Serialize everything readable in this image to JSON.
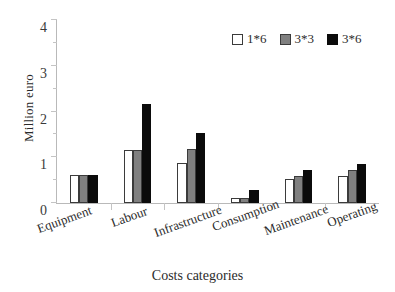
{
  "chart_data": {
    "type": "bar",
    "title": "",
    "xlabel": "Costs categories",
    "ylabel": "Million euro",
    "categories": [
      "Equipment",
      "Labour",
      "Infrastructure",
      "Consumption",
      "Maintenance",
      "Operating"
    ],
    "series": [
      {
        "name": "1*6",
        "color": "#ffffff",
        "values": [
          0.62,
          1.15,
          0.87,
          0.12,
          0.52,
          0.58
        ]
      },
      {
        "name": "3*3",
        "color": "#808080",
        "values": [
          0.62,
          1.15,
          1.18,
          0.12,
          0.59,
          0.73
        ]
      },
      {
        "name": "3*6",
        "color": "#000000",
        "values": [
          0.62,
          2.17,
          1.53,
          0.28,
          0.72,
          0.85
        ]
      }
    ],
    "ylim": [
      0,
      4
    ],
    "yticks": [
      0,
      1,
      2,
      3,
      4
    ],
    "ytick_labels": [
      "0",
      "1",
      "2",
      "3",
      "4"
    ],
    "grid": false,
    "legend_position": "top-right",
    "axis_color": "#b9b9b9",
    "bar_edge_color": "#3b3b3b"
  },
  "axes": {
    "y_title": "Million euro",
    "x_title": "Costs categories"
  }
}
